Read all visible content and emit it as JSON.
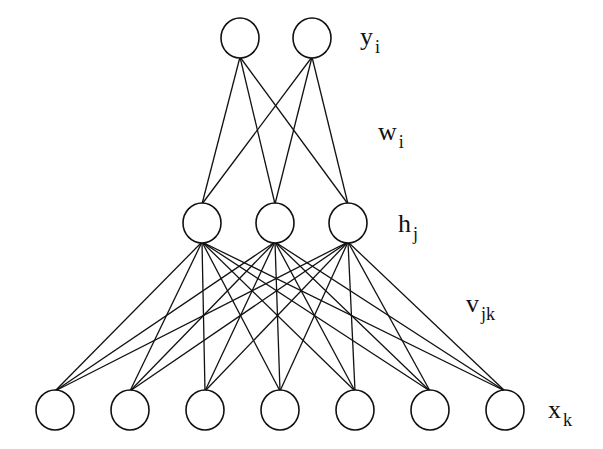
{
  "diagram": {
    "type": "feedforward network",
    "colors": {
      "stroke": "#111111",
      "background": "#ffffff"
    },
    "layers": [
      {
        "id": "output",
        "label": "y",
        "label_sub": "i",
        "label_pos": [
          360,
          45
        ],
        "node_radius": 19,
        "nodes": [
          {
            "x": 240,
            "y": 38
          },
          {
            "x": 312,
            "y": 38
          }
        ]
      },
      {
        "id": "hidden",
        "label": "h",
        "label_sub": "j",
        "label_pos": [
          398,
          232
        ],
        "node_radius": 19,
        "nodes": [
          {
            "x": 202,
            "y": 223
          },
          {
            "x": 275,
            "y": 223
          },
          {
            "x": 348,
            "y": 223
          }
        ]
      },
      {
        "id": "input",
        "label": "x",
        "label_sub": "k",
        "label_pos": [
          548,
          418
        ],
        "node_radius": 19,
        "nodes": [
          {
            "x": 55,
            "y": 410
          },
          {
            "x": 130,
            "y": 410
          },
          {
            "x": 205,
            "y": 410
          },
          {
            "x": 280,
            "y": 410
          },
          {
            "x": 355,
            "y": 410
          },
          {
            "x": 430,
            "y": 410
          },
          {
            "x": 505,
            "y": 410
          }
        ]
      }
    ],
    "weights": [
      {
        "id": "w",
        "label": "w",
        "label_sub": "i",
        "label_pos": [
          378,
          140
        ],
        "connects": [
          "hidden",
          "output"
        ]
      },
      {
        "id": "v",
        "label": "v",
        "label_sub": "jk",
        "label_pos": [
          466,
          312
        ],
        "connects": [
          "input",
          "hidden"
        ]
      }
    ]
  }
}
